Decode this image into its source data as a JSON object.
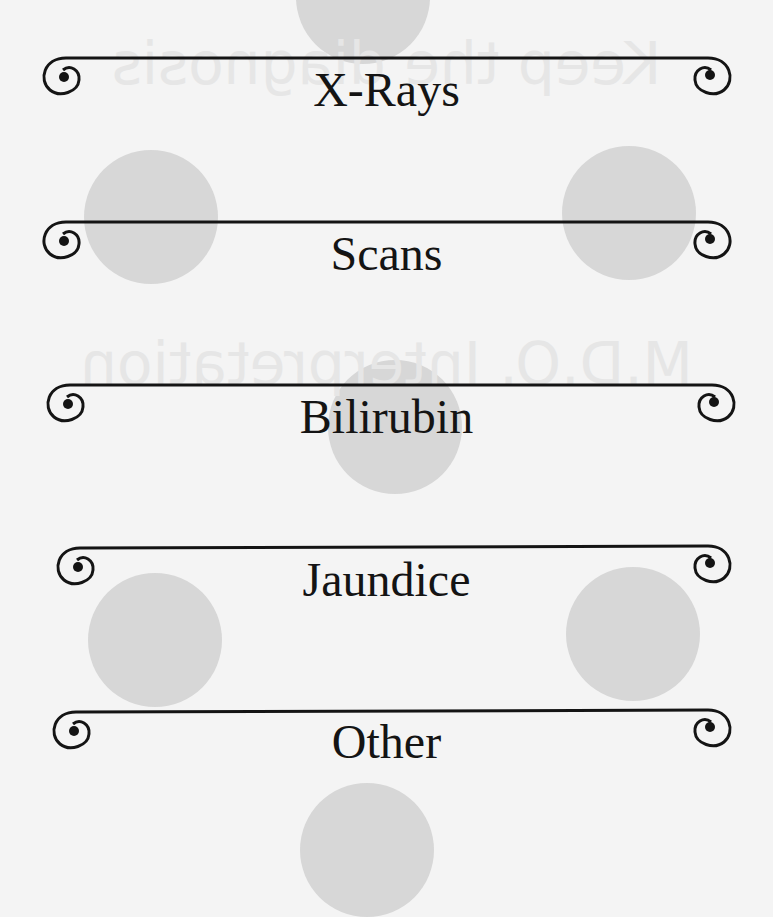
{
  "banners": [
    {
      "label": "X-Rays"
    },
    {
      "label": "Scans"
    },
    {
      "label": "Bilirubin"
    },
    {
      "label": "Jaundice"
    },
    {
      "label": "Other"
    }
  ],
  "ghost_text": {
    "line1": "Keep the diagnosis",
    "line2": "M.D.O. Interpretation"
  },
  "colors": {
    "background": "#f4f4f4",
    "circle": "#d7d7d7",
    "ink": "#141414"
  }
}
